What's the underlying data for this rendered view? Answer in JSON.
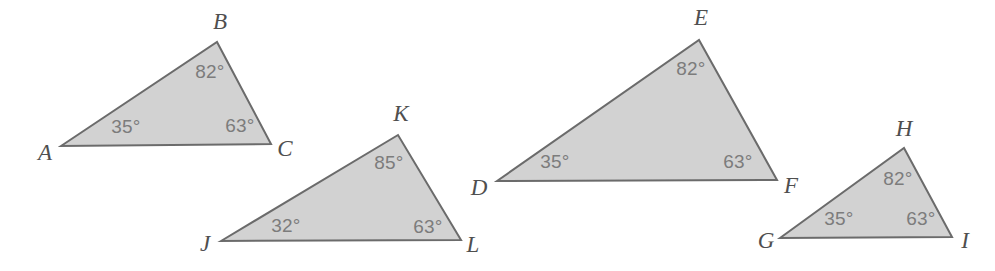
{
  "figure": {
    "width": 995,
    "height": 271,
    "background_color": "#ffffff",
    "degree_symbol": "°",
    "style": {
      "fill_color": "#d2d2d2",
      "stroke_color": "#6b6b6b",
      "stroke_width": 2,
      "angle_text_color": "#7c7c7c",
      "vertex_text_color": "#4f4f4f",
      "angle_font_size": 19,
      "vertex_font_size": 23
    }
  },
  "triangles": [
    {
      "id": "triangle-abc",
      "name": "ABC",
      "fill": "#d2d2d2",
      "stroke": "#6b6b6b",
      "points": "61,146 217,42 271,144",
      "vertices": [
        {
          "letter": "A",
          "label_x": 45,
          "label_y": 155,
          "vertex_x": 61,
          "vertex_y": 146
        },
        {
          "letter": "B",
          "label_x": 220,
          "label_y": 24,
          "vertex_x": 217,
          "vertex_y": 42
        },
        {
          "letter": "C",
          "label_x": 285,
          "label_y": 151,
          "vertex_x": 271,
          "vertex_y": 144
        }
      ],
      "angles": [
        {
          "at": "A",
          "value": "35",
          "text": "35°",
          "x": 126,
          "y": 128
        },
        {
          "at": "B",
          "value": "82",
          "text": "82°",
          "x": 210,
          "y": 73
        },
        {
          "at": "C",
          "value": "63",
          "text": "63°",
          "x": 240,
          "y": 127
        }
      ]
    },
    {
      "id": "triangle-jkl",
      "name": "JKL",
      "fill": "#d2d2d2",
      "stroke": "#6b6b6b",
      "points": "221,241 398,135 461,240",
      "vertices": [
        {
          "letter": "J",
          "label_x": 205,
          "label_y": 246,
          "vertex_x": 221,
          "vertex_y": 241
        },
        {
          "letter": "K",
          "label_x": 401,
          "label_y": 116,
          "vertex_x": 398,
          "vertex_y": 135
        },
        {
          "letter": "L",
          "label_x": 473,
          "label_y": 247,
          "vertex_x": 461,
          "vertex_y": 240
        }
      ],
      "angles": [
        {
          "at": "J",
          "value": "32",
          "text": "32°",
          "x": 286,
          "y": 227
        },
        {
          "at": "K",
          "value": "85",
          "text": "85°",
          "x": 389,
          "y": 164
        },
        {
          "at": "L",
          "value": "63",
          "text": "63°",
          "x": 428,
          "y": 228
        }
      ]
    },
    {
      "id": "triangle-def",
      "name": "DEF",
      "fill": "#d2d2d2",
      "stroke": "#6b6b6b",
      "points": "497,181 699,40 777,180",
      "vertices": [
        {
          "letter": "D",
          "label_x": 479,
          "label_y": 190,
          "vertex_x": 497,
          "vertex_y": 181
        },
        {
          "letter": "E",
          "label_x": 701,
          "label_y": 20,
          "vertex_x": 699,
          "vertex_y": 40
        },
        {
          "letter": "F",
          "label_x": 791,
          "label_y": 188,
          "vertex_x": 777,
          "vertex_y": 180
        }
      ],
      "angles": [
        {
          "at": "D",
          "value": "35",
          "text": "35°",
          "x": 555,
          "y": 163
        },
        {
          "at": "E",
          "value": "82",
          "text": "82°",
          "x": 691,
          "y": 70
        },
        {
          "at": "F",
          "value": "63",
          "text": "63°",
          "x": 738,
          "y": 163
        }
      ]
    },
    {
      "id": "triangle-ghi",
      "name": "GHI",
      "fill": "#d2d2d2",
      "stroke": "#6b6b6b",
      "points": "780,238 904,148 952,237",
      "vertices": [
        {
          "letter": "G",
          "label_x": 766,
          "label_y": 243,
          "vertex_x": 780,
          "vertex_y": 238
        },
        {
          "letter": "H",
          "label_x": 904,
          "label_y": 131,
          "vertex_x": 904,
          "vertex_y": 148
        },
        {
          "letter": "I",
          "label_x": 965,
          "label_y": 243,
          "vertex_x": 952,
          "vertex_y": 237
        }
      ],
      "angles": [
        {
          "at": "G",
          "value": "35",
          "text": "35°",
          "x": 839,
          "y": 220
        },
        {
          "at": "H",
          "value": "82",
          "text": "82°",
          "x": 898,
          "y": 180
        },
        {
          "at": "I",
          "value": "63",
          "text": "63°",
          "x": 921,
          "y": 220
        }
      ]
    }
  ]
}
